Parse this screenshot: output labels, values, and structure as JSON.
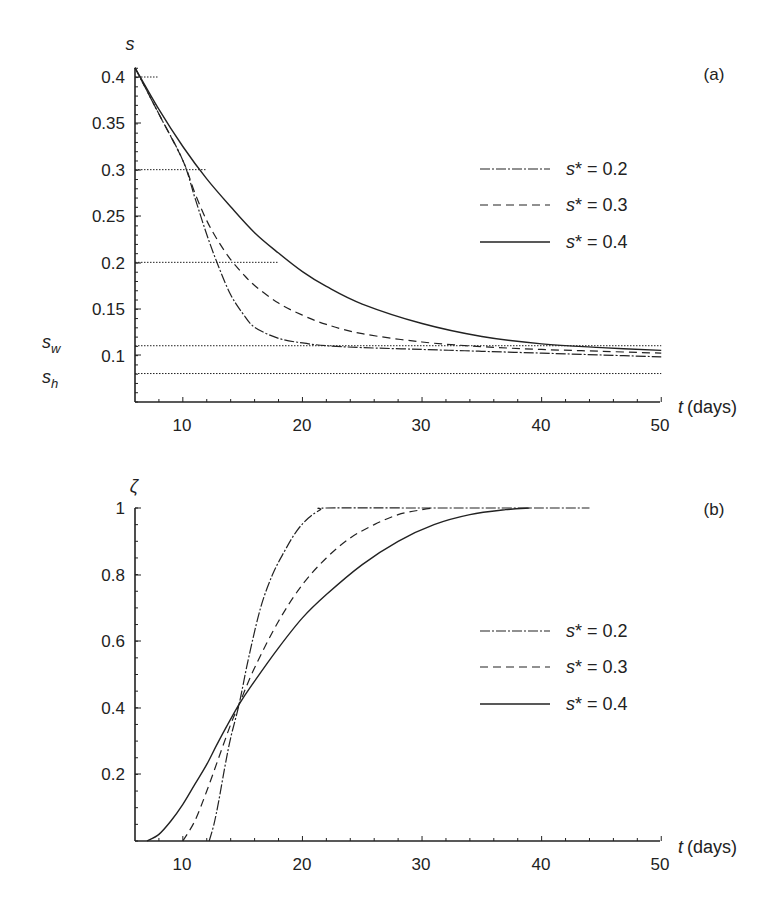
{
  "chart_data": [
    {
      "panel": "(a)",
      "type": "line",
      "title": "",
      "xlabel_var": "t",
      "xlabel_unit": "(days)",
      "ylabel": "s",
      "xlim": [
        6,
        50
      ],
      "ylim": [
        0.05,
        0.41
      ],
      "xticks": [
        "10",
        "20",
        "30",
        "40",
        "50"
      ],
      "yticks": [
        "0.4",
        "0.35",
        "0.3",
        "0.25",
        "0.2",
        "0.15",
        "0.1"
      ],
      "extra_y_labels": [
        {
          "label": "s",
          "sub": "w",
          "value": 0.11
        },
        {
          "label": "s",
          "sub": "h",
          "value": 0.08
        }
      ],
      "reference_lines": [
        {
          "y": 0.4,
          "x_end": 8
        },
        {
          "y": 0.3,
          "x_end": 12
        },
        {
          "y": 0.2,
          "x_end": 18
        },
        {
          "y": 0.11,
          "x_end": 50,
          "name": "s_w"
        },
        {
          "y": 0.08,
          "x_end": 50,
          "name": "s_h"
        }
      ],
      "legend": {
        "position": "right-center",
        "entries": [
          "s* = 0.2",
          "s* = 0.3",
          "s* = 0.4"
        ]
      },
      "grid": false,
      "series": [
        {
          "name": "s* = 0.2",
          "style": "dash-dot",
          "x": [
            6,
            8,
            10,
            11,
            12,
            13,
            14,
            15,
            16,
            18,
            20,
            22,
            25,
            30,
            35,
            40,
            45,
            50
          ],
          "y": [
            0.41,
            0.36,
            0.31,
            0.27,
            0.23,
            0.195,
            0.165,
            0.145,
            0.13,
            0.118,
            0.113,
            0.11,
            0.108,
            0.106,
            0.104,
            0.102,
            0.1,
            0.098
          ]
        },
        {
          "name": "s* = 0.3",
          "style": "dashed",
          "x": [
            6,
            8,
            10,
            11,
            12,
            13,
            14,
            15,
            16,
            18,
            20,
            22,
            25,
            30,
            35,
            40,
            45,
            50
          ],
          "y": [
            0.41,
            0.36,
            0.31,
            0.275,
            0.245,
            0.222,
            0.203,
            0.188,
            0.175,
            0.156,
            0.143,
            0.133,
            0.123,
            0.114,
            0.109,
            0.106,
            0.104,
            0.102
          ]
        },
        {
          "name": "s* = 0.4",
          "style": "solid",
          "x": [
            6,
            8,
            10,
            12,
            14,
            16,
            18,
            20,
            22,
            25,
            30,
            35,
            40,
            45,
            50
          ],
          "y": [
            0.41,
            0.365,
            0.325,
            0.29,
            0.26,
            0.232,
            0.21,
            0.19,
            0.174,
            0.155,
            0.134,
            0.12,
            0.112,
            0.108,
            0.105
          ]
        }
      ]
    },
    {
      "panel": "(b)",
      "type": "line",
      "title": "",
      "xlabel_var": "t",
      "xlabel_unit": "(days)",
      "ylabel": "ζ",
      "xlim": [
        6,
        50
      ],
      "ylim": [
        0,
        1
      ],
      "xticks": [
        "10",
        "20",
        "30",
        "40",
        "50"
      ],
      "yticks": [
        "1",
        "0.8",
        "0.6",
        "0.4",
        "0.2"
      ],
      "legend": {
        "position": "right-center",
        "entries": [
          "s* = 0.2",
          "s* = 0.3",
          "s* = 0.4"
        ]
      },
      "grid": false,
      "series": [
        {
          "name": "s* = 0.2",
          "style": "dash-dot",
          "x": [
            12.2,
            12.6,
            13,
            13.5,
            14,
            14.7,
            15.5,
            16.5,
            17.5,
            18.5,
            19.5,
            20.5,
            21.5,
            22,
            30,
            40,
            44
          ],
          "y": [
            0,
            0.05,
            0.12,
            0.22,
            0.31,
            0.41,
            0.55,
            0.7,
            0.8,
            0.87,
            0.93,
            0.97,
            0.995,
            1,
            1,
            1,
            1
          ]
        },
        {
          "name": "s* = 0.3",
          "style": "dashed",
          "x": [
            10,
            11,
            12,
            13,
            14,
            14.7,
            16,
            18,
            20,
            22,
            24,
            26,
            28,
            30,
            31
          ],
          "y": [
            0,
            0.06,
            0.15,
            0.25,
            0.35,
            0.41,
            0.52,
            0.66,
            0.77,
            0.85,
            0.91,
            0.95,
            0.98,
            0.995,
            1
          ]
        },
        {
          "name": "s* = 0.4",
          "style": "solid",
          "x": [
            7,
            8,
            9,
            10,
            11,
            12,
            13,
            14.7,
            16,
            18,
            20,
            22,
            25,
            28,
            31,
            34,
            37,
            39
          ],
          "y": [
            0,
            0.02,
            0.06,
            0.11,
            0.17,
            0.23,
            0.3,
            0.41,
            0.48,
            0.58,
            0.67,
            0.74,
            0.83,
            0.9,
            0.95,
            0.98,
            0.995,
            1
          ]
        }
      ]
    }
  ],
  "panels": {
    "a": {
      "label": "(a)",
      "y_var": "s",
      "x_var": "t",
      "x_unit": "(days)",
      "sw_main": "s",
      "sw_sub": "w",
      "sh_main": "s",
      "sh_sub": "h",
      "ytick_labels": [
        "0.4",
        "0.35",
        "0.3",
        "0.25",
        "0.2",
        "0.15",
        "0.1"
      ],
      "xtick_labels": [
        "10",
        "20",
        "30",
        "40",
        "50"
      ],
      "legend": [
        {
          "sym": "s",
          "rest": "* = 0.2"
        },
        {
          "sym": "s",
          "rest": "* = 0.3"
        },
        {
          "sym": "s",
          "rest": "* = 0.4"
        }
      ]
    },
    "b": {
      "label": "(b)",
      "y_var": "ζ",
      "x_var": "t",
      "x_unit": "(days)",
      "ytick_labels": [
        "1",
        "0.8",
        "0.6",
        "0.4",
        "0.2"
      ],
      "xtick_labels": [
        "10",
        "20",
        "30",
        "40",
        "50"
      ],
      "legend": [
        {
          "sym": "s",
          "rest": "* = 0.2"
        },
        {
          "sym": "s",
          "rest": "* = 0.3"
        },
        {
          "sym": "s",
          "rest": "* = 0.4"
        }
      ]
    }
  },
  "colors": {
    "ink": "#222222",
    "background": "#ffffff"
  }
}
